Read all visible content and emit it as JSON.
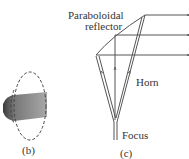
{
  "figure_b": {
    "caption": "(b)"
  },
  "figure_c": {
    "caption": "(c)",
    "labels": {
      "reflector_line1": "Paraboloidal",
      "reflector_line2": "reflector",
      "horn": "Horn",
      "focus": "Focus"
    }
  },
  "colors": {
    "line": "#555555",
    "shade_dark": "#444444",
    "shade_light": "#999999"
  }
}
